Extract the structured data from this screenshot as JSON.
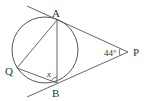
{
  "diagram": {
    "type": "geometry",
    "points": {
      "A": {
        "label": "A",
        "x": 57,
        "y": 20
      },
      "B": {
        "label": "B",
        "x": 57,
        "y": 83
      },
      "Q": {
        "label": "Q",
        "x": 17,
        "y": 68
      },
      "P": {
        "label": "P",
        "x": 128,
        "y": 52
      }
    },
    "circle": {
      "cx": 45,
      "cy": 50,
      "r": 33
    },
    "angle_P": {
      "label": "44°"
    },
    "angle_x": {
      "label": "x"
    },
    "colors": {
      "stroke": "#555555",
      "text": "#333333",
      "background": "#ffffff"
    }
  }
}
